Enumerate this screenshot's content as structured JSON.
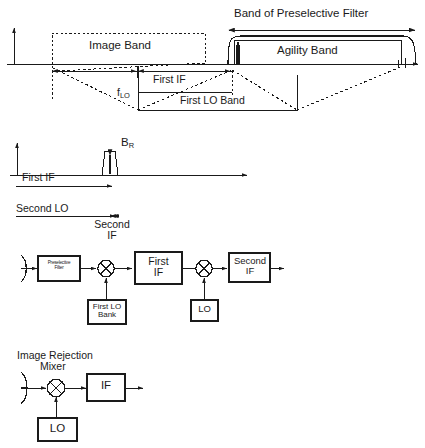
{
  "diagram": {
    "stroke_color": "#1a1a1a",
    "background_color": "#ffffff"
  },
  "panel_spectrum_top": {
    "name": "Preselective filter / agility band spectrum",
    "labels": {
      "band_of_preselective_filter": "Band of Preselective Filter",
      "image_band": "Image Band",
      "agility_band": "Agility Band",
      "first_if": "First IF",
      "first_lo_band": "First LO Band",
      "f_lo_base": "f",
      "f_lo_sub": "LO"
    }
  },
  "panel_spectrum_if": {
    "name": "First IF spectrum with receiver bandwidth",
    "labels": {
      "b_r_base": "B",
      "b_r_sub": "R",
      "first_if": "First IF"
    }
  },
  "panel_block_superhet": {
    "name": "Dual conversion superheterodyne receiver",
    "labels": {
      "second_lo": "Second LO",
      "second_if_arrow_line1": "Second",
      "second_if_arrow_line2": "IF",
      "preselective_filter_line1": "Preselective",
      "preselective_filter_line2": "Filter",
      "first_if_line1": "First",
      "first_if_line2": "IF",
      "second_if_line1": "Second",
      "second_if_line2": "IF",
      "first_lo_bank_line1": "First LO",
      "first_lo_bank_line2": "Bank",
      "lo": "LO"
    }
  },
  "panel_block_image_rejection": {
    "name": "Image rejection mixer receiver",
    "labels": {
      "image_rejection_line1": "Image Rejection",
      "image_rejection_line2": "Mixer",
      "if": "IF",
      "lo": "LO"
    }
  }
}
